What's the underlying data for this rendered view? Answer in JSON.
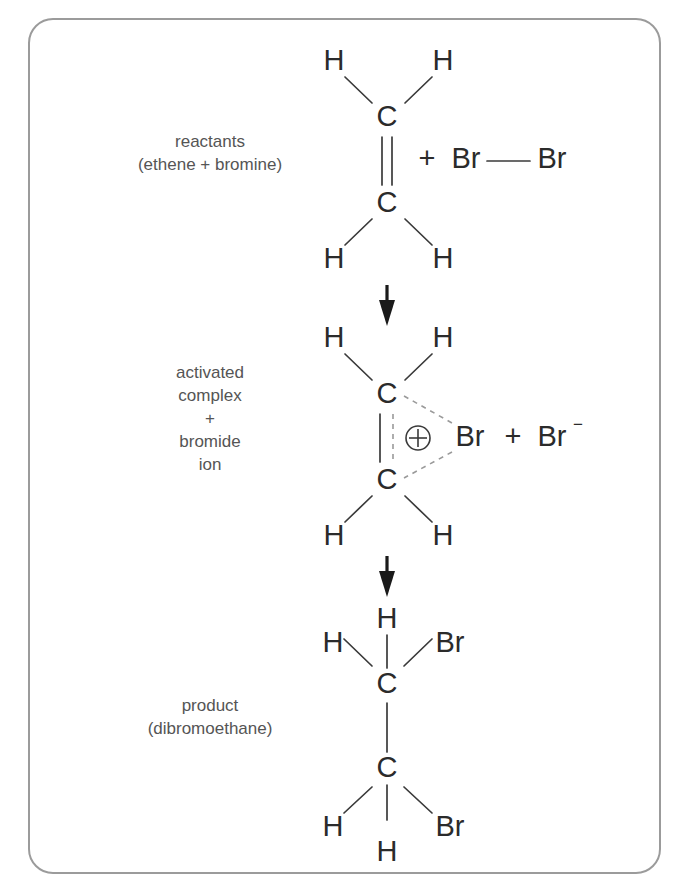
{
  "figure": {
    "frame_color": "#9b9b9b",
    "label_color": "#555555",
    "atom_color": "#2b2b2b",
    "bond_color": "#3a3a3a",
    "dashed_bond_color": "#9a9a9a",
    "arrow_color": "#1a1a1a"
  },
  "stages": [
    {
      "id": "reactants",
      "label_lines": [
        "reactants",
        "(ethene + bromine)"
      ],
      "atoms": {
        "h_top_left": "H",
        "h_top_right": "H",
        "c_top": "C",
        "c_bottom": "C",
        "h_bottom_left": "H",
        "h_bottom_right": "H",
        "plus": "+",
        "br_left": "Br",
        "br_right": "Br"
      },
      "bond_note": "C=C double bond, Br—Br single bond"
    },
    {
      "id": "activated-complex",
      "label_lines": [
        "activated",
        "complex",
        "+",
        "bromide",
        "ion"
      ],
      "atoms": {
        "h_top_left": "H",
        "h_top_right": "H",
        "c_top": "C",
        "c_bottom": "C",
        "h_bottom_left": "H",
        "h_bottom_right": "H",
        "charge_symbol": "⊕",
        "br_bonded": "Br",
        "plus": "+",
        "br_ion": "Br",
        "br_ion_charge": "−"
      },
      "bond_note": "partial C=C with dashed bridging bonds to Br(+)"
    },
    {
      "id": "product",
      "label_lines": [
        "product",
        "(dibromoethane)"
      ],
      "atoms": {
        "h_top": "H",
        "h_top_left": "H",
        "br_top_right": "Br",
        "c_top": "C",
        "c_bottom": "C",
        "h_bottom_left": "H",
        "h_bottom": "H",
        "br_bottom_right": "Br"
      },
      "bond_note": "C—C single bond, each carbon bearing two H and one Br"
    }
  ],
  "arrows": [
    {
      "id": "arrow-reactants-to-complex",
      "direction": "down"
    },
    {
      "id": "arrow-complex-to-product",
      "direction": "down"
    }
  ]
}
